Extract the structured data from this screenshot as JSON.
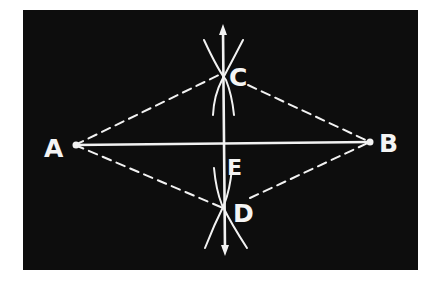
{
  "diagram": {
    "colors": {
      "background": "#ffffff",
      "panel": "#0d0d0d",
      "stroke": "#f2f2f2"
    },
    "points": {
      "A": {
        "label": "A",
        "x": 75,
        "y": 145
      },
      "B": {
        "label": "B",
        "x": 370,
        "y": 142
      },
      "C": {
        "label": "C",
        "x": 223,
        "y": 73
      },
      "D": {
        "label": "D",
        "x": 223,
        "y": 208
      },
      "E": {
        "label": "E",
        "x": 223,
        "y": 144
      }
    },
    "segments": [
      {
        "from": "A",
        "to": "B",
        "style": "solid"
      },
      {
        "from": "A",
        "to": "C",
        "style": "dashed"
      },
      {
        "from": "C",
        "to": "B",
        "style": "dashed"
      },
      {
        "from": "A",
        "to": "D",
        "style": "dashed"
      },
      {
        "from": "D",
        "to": "B",
        "style": "dashed"
      },
      {
        "from": "top-arrow",
        "to": "bottom-arrow",
        "style": "solid-double-arrow",
        "note": "perpendicular bisector through C, E, D"
      }
    ]
  }
}
